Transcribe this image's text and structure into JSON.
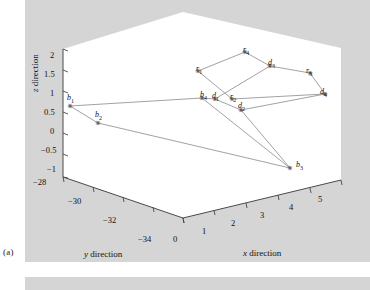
{
  "figure": {
    "caption": "(a)",
    "background_color": "#d5d5d5",
    "panel_color": "#ffffff"
  },
  "chart_data": {
    "type": "scatter",
    "title": "",
    "projection": "3d",
    "xlabel": "x direction",
    "ylabel": "y direction",
    "zlabel": "z direction",
    "xlim": [
      0,
      5
    ],
    "ylim": [
      -34,
      -28
    ],
    "zlim": [
      -1,
      2
    ],
    "xticks": [
      "0",
      "1",
      "2",
      "3",
      "4",
      "5"
    ],
    "yticks": [
      "-28",
      "-30",
      "-32",
      "-34"
    ],
    "zticks": [
      "2",
      "1.5",
      "1",
      "0.5",
      "0",
      "-0.5",
      "-1"
    ],
    "grid": false,
    "legend": "none",
    "marker": "asterisk",
    "point_color": "#555555",
    "line_color": "#777777",
    "points": [
      {
        "label": "b",
        "sub": "1",
        "x": 0.15,
        "y": -28.6,
        "z": 1.05,
        "px": 70,
        "py": 106,
        "lx": 67,
        "ly": 93
      },
      {
        "label": "b",
        "sub": "2",
        "x": 0.75,
        "y": -29.6,
        "z": 0.55,
        "px": 98,
        "py": 123,
        "lx": 95,
        "ly": 110
      },
      {
        "label": "b",
        "sub": "3",
        "x": 3.45,
        "y": -32.8,
        "z": -0.52,
        "px": 290,
        "py": 168,
        "lx": 296,
        "ly": 160
      },
      {
        "label": "b",
        "sub": "4",
        "x": 1.6,
        "y": -30.4,
        "z": 1.2,
        "px": 202,
        "py": 98,
        "lx": 200,
        "ly": 90
      },
      {
        "label": "d",
        "sub": "1",
        "x": 1.75,
        "y": -30.4,
        "z": 1.18,
        "px": 215,
        "py": 99,
        "lx": 212,
        "ly": 91
      },
      {
        "label": "d",
        "sub": "2",
        "x": 2.35,
        "y": -30.6,
        "z": 1.0,
        "px": 241,
        "py": 110,
        "lx": 238,
        "ly": 101
      },
      {
        "label": "d",
        "sub": "3",
        "x": 3.2,
        "y": -29.3,
        "z": 1.78,
        "px": 270,
        "py": 66,
        "lx": 268,
        "ly": 58
      },
      {
        "label": "d",
        "sub": "4",
        "x": 4.55,
        "y": -30.2,
        "z": 1.28,
        "px": 325,
        "py": 94,
        "lx": 320,
        "ly": 87
      },
      {
        "label": "r",
        "sub": "1",
        "x": 1.45,
        "y": -29.0,
        "z": 1.78,
        "px": 198,
        "py": 71,
        "lx": 196,
        "ly": 64
      },
      {
        "label": "r",
        "sub": "2",
        "x": 2.25,
        "y": -30.5,
        "z": 1.15,
        "px": 232,
        "py": 99,
        "lx": 230,
        "ly": 92
      },
      {
        "label": "r",
        "sub": "3",
        "x": 4.2,
        "y": -29.2,
        "z": 1.62,
        "px": 310,
        "py": 73,
        "lx": 306,
        "ly": 66
      },
      {
        "label": "r",
        "sub": "4",
        "x": 2.6,
        "y": -28.4,
        "z": 1.95,
        "px": 245,
        "py": 52,
        "lx": 243,
        "ly": 45
      }
    ],
    "segments": [
      [
        "b1",
        "b4"
      ],
      [
        "b1",
        "b2"
      ],
      [
        "b2",
        "b3"
      ],
      [
        "b3",
        "b4"
      ],
      [
        "b3",
        "d2"
      ],
      [
        "r1",
        "r4"
      ],
      [
        "r4",
        "d3"
      ],
      [
        "d3",
        "r3"
      ],
      [
        "r3",
        "d4"
      ],
      [
        "d4",
        "r2"
      ],
      [
        "r2",
        "r1"
      ],
      [
        "d1",
        "d3"
      ],
      [
        "d1",
        "d2"
      ],
      [
        "d2",
        "d4"
      ]
    ],
    "annotations": [
      "b1",
      "b2",
      "b3",
      "b4",
      "d1",
      "d2",
      "d3",
      "d4",
      "r1",
      "r2",
      "r3",
      "r4"
    ]
  },
  "axes": {
    "z": {
      "name_html": "z direction",
      "ticks": [
        {
          "text": "2",
          "x": 50,
          "y": 50
        },
        {
          "text": "1.5",
          "x": 44,
          "y": 69
        },
        {
          "text": "1",
          "x": 50,
          "y": 88
        },
        {
          "text": "0.5",
          "x": 44,
          "y": 107
        },
        {
          "text": "0",
          "x": 50,
          "y": 126
        },
        {
          "text": "-0.5",
          "x": 41,
          "y": 145
        },
        {
          "text": "-1",
          "x": 47,
          "y": 164
        }
      ]
    },
    "y": {
      "name_html": "y direction",
      "ticks": [
        {
          "text": "-28",
          "x": 33,
          "y": 177
        },
        {
          "text": "-30",
          "x": 68,
          "y": 196
        },
        {
          "text": "-32",
          "x": 103,
          "y": 215
        },
        {
          "text": "-34",
          "x": 138,
          "y": 234
        }
      ]
    },
    "x": {
      "name_html": "x direction",
      "ticks": [
        {
          "text": "0",
          "x": 173,
          "y": 234
        },
        {
          "text": "1",
          "x": 202,
          "y": 226
        },
        {
          "text": "2",
          "x": 231,
          "y": 218
        },
        {
          "text": "3",
          "x": 260,
          "y": 210
        },
        {
          "text": "4",
          "x": 289,
          "y": 202
        },
        {
          "text": "5",
          "x": 318,
          "y": 194
        }
      ]
    }
  }
}
